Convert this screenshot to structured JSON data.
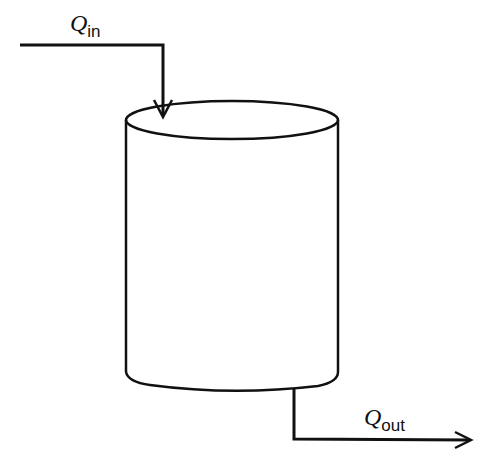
{
  "diagram": {
    "type": "tank-flow",
    "inflow": {
      "symbol": "Q",
      "subscript": "in"
    },
    "outflow": {
      "symbol": "Q",
      "subscript": "out"
    },
    "colors": {
      "stroke": "#111111",
      "background": "#ffffff"
    }
  }
}
